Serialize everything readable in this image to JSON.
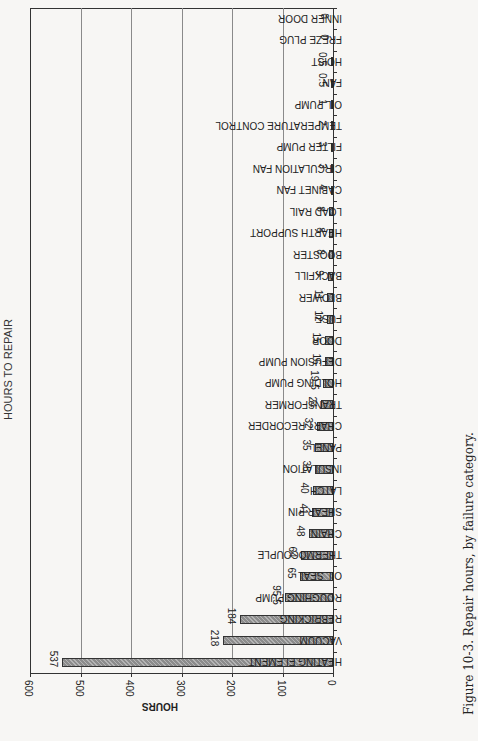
{
  "chart_data": {
    "type": "bar",
    "orientation": "horizontal (page printed rotated 90°)",
    "title": "HOURS TO REPAIR",
    "caption": "Figure 10-3. Repair hours, by failure category.",
    "xlabel": "",
    "ylabel": "HOURS",
    "ylim": [
      0,
      600
    ],
    "yticks": [
      "0",
      "100",
      "200",
      "300",
      "400",
      "500",
      "600"
    ],
    "grid": true,
    "legend": "none",
    "categories": [
      "HEATING ELEMENT",
      "VACUUM",
      "REBRICKING",
      "ROUGHING PUMP",
      "OIL SEAL",
      "THERMOCOUPLE",
      "CHAIN",
      "SHEAR PIN",
      "LATCH",
      "INSULATION",
      "PANEL",
      "CHART RECORDER",
      "TRANSFORMER",
      "HOLDING PUMP",
      "DEFUSION PUMP",
      "DOOR",
      "FUSE",
      "BLOWER",
      "BACKFILL",
      "BOOSTER",
      "HEARTH SUPPORT",
      "LOAD RAIL",
      "CABINET FAN",
      "CIRCULATION FAN",
      "FILTER PUMP",
      "TEMPERATURE CONTROL",
      "OIL PUMP",
      "FAN",
      "HOIST",
      "FREZE PLUG",
      "INNER DOOR"
    ],
    "values": [
      537,
      218,
      184,
      95.5,
      65,
      64,
      48,
      41,
      40,
      36,
      35,
      32,
      24,
      19.5,
      16,
      15,
      12,
      11,
      9,
      8,
      8,
      8,
      4,
      3,
      3,
      2,
      1,
      0.5,
      0.5,
      0,
      0
    ],
    "value_labels": [
      "537",
      "218",
      "184",
      "95.5",
      "65",
      "64",
      "48",
      "41",
      "40",
      "36",
      "35",
      "32",
      "24",
      "19.5",
      "16",
      "15",
      "12",
      "11",
      "9",
      "8",
      "8",
      "8",
      "4",
      "3",
      "3",
      "2",
      "1",
      "0.5",
      "0.5",
      "0",
      "0"
    ],
    "colors": {
      "bar_fill": "#8c8c8c",
      "bar_border": "#333333",
      "grid": "#8a8a8a",
      "background": "#f7f6f4"
    }
  }
}
